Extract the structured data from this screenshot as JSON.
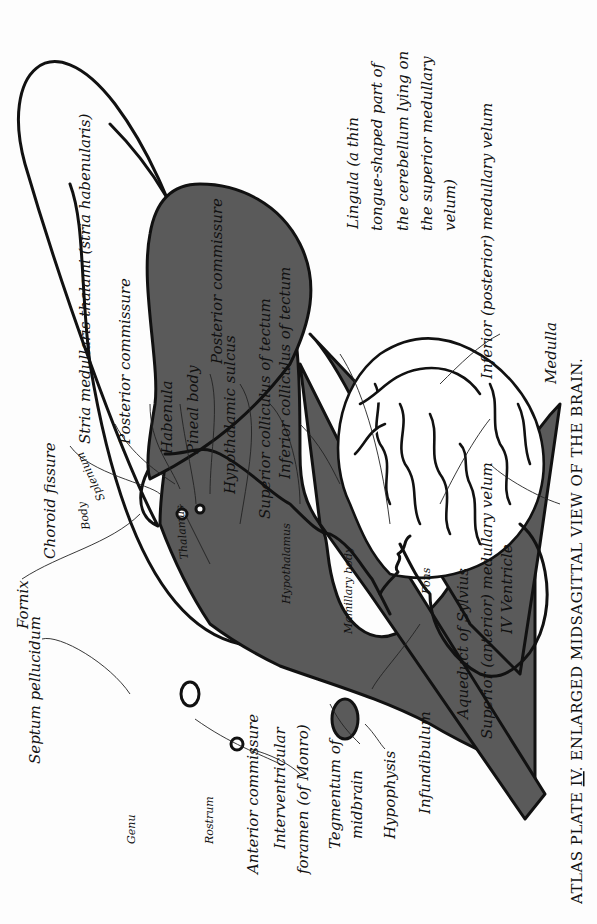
{
  "plate": {
    "caption": "Atlas Plate IV. Enlarged Midsagittal View of the Brain.",
    "caption_parts": {
      "prefix": "ATLAS PLATE ",
      "numeral": "IV",
      "suffix": ". ENLARGED MIDSAGITTAL VIEW OF THE BRAIN."
    },
    "orientation": "rotated 90° counter-clockwise"
  },
  "colors": {
    "shaded_region": "#5a5a5a",
    "ink": "#111111",
    "paper": "#fdfdfd"
  },
  "labels": {
    "septum_pellucidum": "Septum pellucidum",
    "fornix": "Fornix",
    "choroid_fissure": "Choroid fissure",
    "body": "Body",
    "splenium": "Splenium",
    "genu": "Genu",
    "rostrum": "Rostrum",
    "stria_medullaris": "Stria medullaris thalami (stria habenularis)",
    "posterior_commissure_1": "Posterior commissure",
    "habenula": "Habenula",
    "pineal_body": "Pineal body",
    "posterior_commissure_2": "Posterior commissure",
    "hypothalamic_sulcus": "Hypothalamic sulcus",
    "superior_colliculus": "Superior colliculus of tectum",
    "inferior_colliculus": "Inferior colliculus of tectum",
    "lingula_line1": "Lingula (a thin",
    "lingula_line2": "tongue-shaped part of",
    "lingula_line3": "the cerebellum lying on",
    "lingula_line4": "the superior medullary",
    "lingula_line5": "velum)",
    "inferior_medullary_velum": "Inferior (posterior) medullary velum",
    "medulla": "Medulla",
    "thalamus": "Thalamus",
    "hypothalamus": "Hypothalamus",
    "mamillary_body": "Mamillary body",
    "pons": "Pons",
    "anterior_commissure": "Anterior commissure",
    "interventricular_foramen_1": "Interventricular",
    "interventricular_foramen_2": "foramen (of Monro)",
    "tegmentum_1": "Tegmentum of",
    "tegmentum_2": "midbrain",
    "hypophysis": "Hypophysis",
    "infundibulum": "Infundibulum",
    "aqueduct": "Aqueduct of Sylvius",
    "superior_medullary_velum": "Superior (anterior) medullary velum",
    "fourth_ventricle": "IV Ventricle"
  }
}
